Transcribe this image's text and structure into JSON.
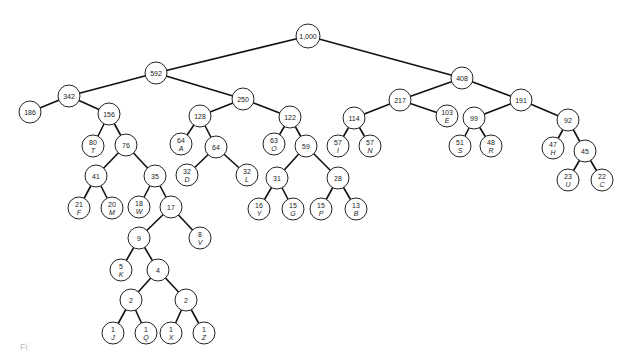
{
  "diagram": {
    "type": "huffman-tree",
    "nodes": [
      {
        "id": "n1000",
        "weight": "1,000",
        "letter": "",
        "x": 308,
        "y": 36
      },
      {
        "id": "n592",
        "weight": "592",
        "letter": "",
        "x": 156,
        "y": 73
      },
      {
        "id": "n408",
        "weight": "408",
        "letter": "",
        "x": 462,
        "y": 78
      },
      {
        "id": "n342",
        "weight": "342",
        "letter": "",
        "x": 69,
        "y": 96
      },
      {
        "id": "n250",
        "weight": "250",
        "letter": "",
        "x": 243,
        "y": 99
      },
      {
        "id": "n217",
        "weight": "217",
        "letter": "",
        "x": 400,
        "y": 100
      },
      {
        "id": "n191",
        "weight": "191",
        "letter": "",
        "x": 521,
        "y": 100
      },
      {
        "id": "n186",
        "weight": "186",
        "letter": "",
        "x": 30,
        "y": 112
      },
      {
        "id": "n156",
        "weight": "156",
        "letter": "",
        "x": 109,
        "y": 114
      },
      {
        "id": "n128",
        "weight": "128",
        "letter": "",
        "x": 200,
        "y": 116
      },
      {
        "id": "n122",
        "weight": "122",
        "letter": "",
        "x": 290,
        "y": 117
      },
      {
        "id": "n114",
        "weight": "114",
        "letter": "",
        "x": 354,
        "y": 118
      },
      {
        "id": "n103",
        "weight": "103",
        "letter": "E",
        "x": 447,
        "y": 116
      },
      {
        "id": "n99",
        "weight": "99",
        "letter": "",
        "x": 474,
        "y": 118
      },
      {
        "id": "n92",
        "weight": "92",
        "letter": "",
        "x": 568,
        "y": 120
      },
      {
        "id": "n80",
        "weight": "80",
        "letter": "T",
        "x": 93,
        "y": 146
      },
      {
        "id": "n76",
        "weight": "76",
        "letter": "",
        "x": 126,
        "y": 145
      },
      {
        "id": "n64A",
        "weight": "64",
        "letter": "A",
        "x": 181,
        "y": 144
      },
      {
        "id": "n64",
        "weight": "64",
        "letter": "",
        "x": 216,
        "y": 147
      },
      {
        "id": "n63",
        "weight": "63",
        "letter": "O",
        "x": 274,
        "y": 144
      },
      {
        "id": "n59",
        "weight": "59",
        "letter": "",
        "x": 306,
        "y": 146
      },
      {
        "id": "n57I",
        "weight": "57",
        "letter": "I",
        "x": 338,
        "y": 146
      },
      {
        "id": "n57N",
        "weight": "57",
        "letter": "N",
        "x": 370,
        "y": 146
      },
      {
        "id": "n51",
        "weight": "51",
        "letter": "S",
        "x": 460,
        "y": 146
      },
      {
        "id": "n48",
        "weight": "48",
        "letter": "R",
        "x": 491,
        "y": 146
      },
      {
        "id": "n47",
        "weight": "47",
        "letter": "H",
        "x": 553,
        "y": 148
      },
      {
        "id": "n45",
        "weight": "45",
        "letter": "",
        "x": 585,
        "y": 151
      },
      {
        "id": "n41",
        "weight": "41",
        "letter": "",
        "x": 96,
        "y": 176
      },
      {
        "id": "n35",
        "weight": "35",
        "letter": "",
        "x": 155,
        "y": 176
      },
      {
        "id": "n32D",
        "weight": "32",
        "letter": "D",
        "x": 187,
        "y": 175
      },
      {
        "id": "n32L",
        "weight": "32",
        "letter": "L",
        "x": 247,
        "y": 175
      },
      {
        "id": "n31",
        "weight": "31",
        "letter": "",
        "x": 277,
        "y": 178
      },
      {
        "id": "n28",
        "weight": "28",
        "letter": "",
        "x": 338,
        "y": 178
      },
      {
        "id": "n23",
        "weight": "23",
        "letter": "U",
        "x": 568,
        "y": 180
      },
      {
        "id": "n22",
        "weight": "22",
        "letter": "C",
        "x": 602,
        "y": 180
      },
      {
        "id": "n21",
        "weight": "21",
        "letter": "F",
        "x": 79,
        "y": 208
      },
      {
        "id": "n20",
        "weight": "20",
        "letter": "M",
        "x": 112,
        "y": 208
      },
      {
        "id": "n18",
        "weight": "18",
        "letter": "W",
        "x": 139,
        "y": 207
      },
      {
        "id": "n17",
        "weight": "17",
        "letter": "",
        "x": 171,
        "y": 207
      },
      {
        "id": "n16",
        "weight": "16",
        "letter": "Y",
        "x": 259,
        "y": 209
      },
      {
        "id": "n15G",
        "weight": "15",
        "letter": "G",
        "x": 293,
        "y": 209
      },
      {
        "id": "n15P",
        "weight": "15",
        "letter": "P",
        "x": 321,
        "y": 209
      },
      {
        "id": "n13",
        "weight": "13",
        "letter": "B",
        "x": 356,
        "y": 209
      },
      {
        "id": "n9",
        "weight": "9",
        "letter": "",
        "x": 139,
        "y": 238
      },
      {
        "id": "n8",
        "weight": "8",
        "letter": "V",
        "x": 200,
        "y": 238
      },
      {
        "id": "n5",
        "weight": "5",
        "letter": "K",
        "x": 121,
        "y": 270
      },
      {
        "id": "n4",
        "weight": "4",
        "letter": "",
        "x": 158,
        "y": 270
      },
      {
        "id": "n2a",
        "weight": "2",
        "letter": "",
        "x": 131,
        "y": 300
      },
      {
        "id": "n2b",
        "weight": "2",
        "letter": "",
        "x": 186,
        "y": 300
      },
      {
        "id": "n1J",
        "weight": "1",
        "letter": "J",
        "x": 113,
        "y": 333
      },
      {
        "id": "n1Q",
        "weight": "1",
        "letter": "Q",
        "x": 146,
        "y": 333
      },
      {
        "id": "n1X",
        "weight": "1",
        "letter": "X",
        "x": 171,
        "y": 333
      },
      {
        "id": "n1Z",
        "weight": "1",
        "letter": "Z",
        "x": 204,
        "y": 333
      }
    ],
    "edges": [
      [
        "n1000",
        "n592"
      ],
      [
        "n1000",
        "n408"
      ],
      [
        "n592",
        "n342"
      ],
      [
        "n592",
        "n250"
      ],
      [
        "n342",
        "n186"
      ],
      [
        "n342",
        "n156"
      ],
      [
        "n156",
        "n80"
      ],
      [
        "n156",
        "n76"
      ],
      [
        "n76",
        "n41"
      ],
      [
        "n76",
        "n35"
      ],
      [
        "n41",
        "n21"
      ],
      [
        "n41",
        "n20"
      ],
      [
        "n35",
        "n18"
      ],
      [
        "n35",
        "n17"
      ],
      [
        "n17",
        "n9"
      ],
      [
        "n17",
        "n8"
      ],
      [
        "n9",
        "n5"
      ],
      [
        "n9",
        "n4"
      ],
      [
        "n4",
        "n2a"
      ],
      [
        "n4",
        "n2b"
      ],
      [
        "n2a",
        "n1J"
      ],
      [
        "n2a",
        "n1Q"
      ],
      [
        "n2b",
        "n1X"
      ],
      [
        "n2b",
        "n1Z"
      ],
      [
        "n250",
        "n128"
      ],
      [
        "n250",
        "n122"
      ],
      [
        "n128",
        "n64A"
      ],
      [
        "n128",
        "n64"
      ],
      [
        "n64",
        "n32D"
      ],
      [
        "n64",
        "n32L"
      ],
      [
        "n122",
        "n63"
      ],
      [
        "n122",
        "n59"
      ],
      [
        "n59",
        "n31"
      ],
      [
        "n59",
        "n28"
      ],
      [
        "n31",
        "n16"
      ],
      [
        "n31",
        "n15G"
      ],
      [
        "n28",
        "n15P"
      ],
      [
        "n28",
        "n13"
      ],
      [
        "n408",
        "n217"
      ],
      [
        "n408",
        "n191"
      ],
      [
        "n217",
        "n114"
      ],
      [
        "n217",
        "n103"
      ],
      [
        "n114",
        "n57I"
      ],
      [
        "n114",
        "n57N"
      ],
      [
        "n191",
        "n99"
      ],
      [
        "n191",
        "n92"
      ],
      [
        "n99",
        "n51"
      ],
      [
        "n99",
        "n48"
      ],
      [
        "n92",
        "n47"
      ],
      [
        "n92",
        "n45"
      ],
      [
        "n45",
        "n23"
      ],
      [
        "n45",
        "n22"
      ]
    ],
    "node_radius": 11
  },
  "caption": "Fi"
}
